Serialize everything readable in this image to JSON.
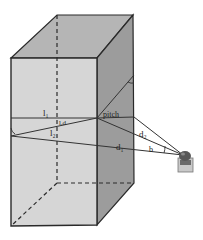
{
  "diagram": {
    "labels": {
      "l1": "l₁",
      "l2": "l₂",
      "lrd": "lᵣd",
      "pitch": "pitch",
      "d1": "d₁",
      "d2": "d₂",
      "b": "b"
    },
    "colors": {
      "front_face": "#d3d3d3",
      "top_face": "#b4b4b4",
      "side_face": "#9a9a9a",
      "edge": "#2a2a2a",
      "sensor_top": "#555555",
      "sensor_body": "#c8c8c8"
    }
  }
}
